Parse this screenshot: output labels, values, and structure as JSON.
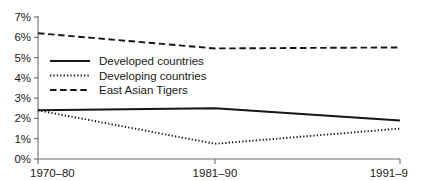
{
  "chart_data": {
    "type": "line",
    "title": "",
    "subtitle": "",
    "xlabel": "",
    "ylabel": "",
    "categories": [
      "1970–80",
      "1981–90",
      "1991–9"
    ],
    "series": [
      {
        "name": "Developed countries",
        "style": "solid",
        "values": [
          2.4,
          2.5,
          1.9
        ]
      },
      {
        "name": "Developing countries",
        "style": "dotted",
        "values": [
          2.4,
          0.75,
          1.5
        ]
      },
      {
        "name": "East Asian Tigers",
        "style": "dashed",
        "values": [
          6.2,
          5.45,
          5.5
        ]
      }
    ],
    "ylim": [
      0,
      7
    ],
    "ytick_values": [
      0,
      1,
      2,
      3,
      4,
      5,
      6,
      7
    ],
    "ytick_labels": [
      "0%",
      "1%",
      "2%",
      "3%",
      "4%",
      "5%",
      "6%",
      "7%"
    ],
    "xtick_labels": [
      "1970–80",
      "1981–90",
      "1991–9"
    ],
    "grid": false,
    "legend_position": "upper-left-inside",
    "line_color": "#161616",
    "axis_color": "#6b6b6b",
    "background_color": "#ffffff"
  },
  "legend": {
    "entries": [
      {
        "label": "Developed countries",
        "style": "solid"
      },
      {
        "label": "Developing countries",
        "style": "dotted"
      },
      {
        "label": "East Asian Tigers",
        "style": "dashed"
      }
    ]
  }
}
